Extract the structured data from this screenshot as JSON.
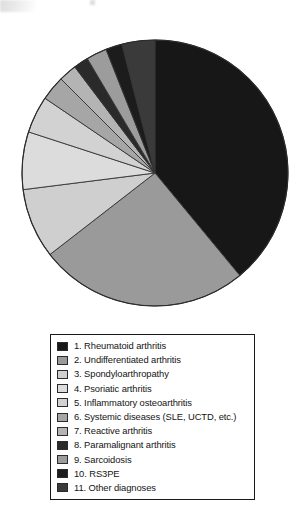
{
  "figure": {
    "title": "",
    "background": "#ffffff",
    "outline_color": "#2b2b2b"
  },
  "pie": {
    "center_x": 155,
    "center_y": 173,
    "radius": 133,
    "start_angle_deg": -90,
    "direction": "clockwise",
    "stroke_color": "#333333",
    "stroke_width": 0.9
  },
  "legend": {
    "border_color": "#1a1a1a",
    "background": "#ffffff",
    "items": [
      {
        "number": "1.",
        "label": "1. Rheumatoid arthritis",
        "color": "#171717"
      },
      {
        "number": "2.",
        "label": "2. Undifferentiated arthritis",
        "color": "#9a9a9a"
      },
      {
        "number": "3.",
        "label": "3. Spondyloarthropathy",
        "color": "#cfcfcf"
      },
      {
        "number": "4.",
        "label": "4. Psoriatic arthritis",
        "color": "#dcdcdc"
      },
      {
        "number": "5.",
        "label": "5. Inflammatory osteoarthritis",
        "color": "#d2d2d2"
      },
      {
        "number": "6.",
        "label": "6. Systemic diseases (SLE, UCTD, etc.)",
        "color": "#a6a6a6"
      },
      {
        "number": "7.",
        "label": "7. Reactive arthritis",
        "color": "#b4b4b4"
      },
      {
        "number": "8.",
        "label": "8. Paramalignant arthritis",
        "color": "#2a2a2a"
      },
      {
        "number": "9.",
        "label": "9. Sarcoidosis",
        "color": "#9c9c9c"
      },
      {
        "number": "10.",
        "label": "10. RS3PE",
        "color": "#1c1c1c"
      },
      {
        "number": "11.",
        "label": "11. Other diagnoses",
        "color": "#3a3a3a"
      }
    ]
  },
  "chart_data": {
    "type": "pie",
    "title": "",
    "subtitle": "",
    "xlabel": "",
    "ylabel": "",
    "grid": false,
    "legend_position": "bottom",
    "units": "percent",
    "start_angle_deg": -90,
    "direction": "clockwise",
    "labels": [
      "1. Rheumatoid arthritis",
      "2. Undifferentiated arthritis",
      "3. Spondyloarthropathy",
      "4. Psoriatic arthritis",
      "5. Inflammatory osteoarthritis",
      "6. Systemic diseases (SLE, UCTD, etc.)",
      "7. Reactive arthritis",
      "8. Paramalignant arthritis",
      "9. Sarcoidosis",
      "10. RS3PE",
      "11. Other diagnoses"
    ],
    "values": [
      39.0,
      25.5,
      8.5,
      7.0,
      4.5,
      3.0,
      2.2,
      1.8,
      2.5,
      2.0,
      4.0
    ],
    "colors": [
      "#171717",
      "#9a9a9a",
      "#cfcfcf",
      "#dcdcdc",
      "#d2d2d2",
      "#a6a6a6",
      "#b4b4b4",
      "#2a2a2a",
      "#9c9c9c",
      "#1c1c1c",
      "#3a3a3a"
    ]
  }
}
